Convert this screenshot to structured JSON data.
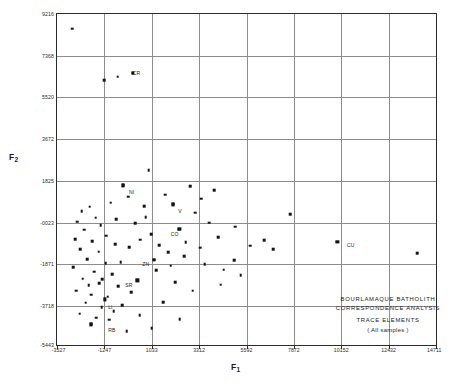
{
  "chart_data": {
    "type": "scatter",
    "title": "",
    "xlabel": "F1",
    "ylabel": "F2",
    "xlim": [
      -3527,
      14711
    ],
    "ylim": [
      -5443,
      9216
    ],
    "grid": true,
    "legend": null,
    "xticks": [
      "-3527",
      "-1247",
      "1033",
      "3312",
      "5592",
      "7872",
      "10152",
      "12432",
      "14711"
    ],
    "xtick_values": [
      -3527,
      -1247,
      1033,
      3312,
      5592,
      7872,
      10152,
      12432,
      14711
    ],
    "yticks": [
      "9216",
      "7368",
      "5520",
      "3672",
      "1825",
      "-0023",
      "-1871",
      "-3718",
      "-5443"
    ],
    "ytick_values": [
      9216,
      7368,
      5520,
      3672,
      1825,
      -23,
      -1871,
      -3718,
      -5443
    ],
    "annotations": [
      {
        "label": "CR",
        "x": 20.0,
        "y": 83.0
      },
      {
        "label": "NI",
        "x": 19.0,
        "y": 47.0
      },
      {
        "label": "V",
        "x": 32.0,
        "y": 41.5
      },
      {
        "label": "CO",
        "x": 30.0,
        "y": 34.5
      },
      {
        "label": "ZN",
        "x": 22.5,
        "y": 25.5
      },
      {
        "label": "SR",
        "x": 18.0,
        "y": 19.0
      },
      {
        "label": "LI",
        "x": 13.5,
        "y": 12.5
      },
      {
        "label": "RB",
        "x": 13.5,
        "y": 5.5
      },
      {
        "label": "CU",
        "x": 76.5,
        "y": 31.0
      }
    ],
    "labeled_points": [
      {
        "label": "CR",
        "xpct": 20.0,
        "ypct": 82.2
      },
      {
        "label": "NI",
        "xpct": 17.4,
        "ypct": 48.2
      },
      {
        "label": "V",
        "xpct": 30.6,
        "ypct": 42.5
      },
      {
        "label": "CO",
        "xpct": 32.3,
        "ypct": 35.0
      },
      {
        "label": "ZN",
        "xpct": 25.6,
        "ypct": 25.8
      },
      {
        "label": "SR",
        "xpct": 21.2,
        "ypct": 19.5
      },
      {
        "label": "LI",
        "xpct": 12.6,
        "ypct": 13.8
      },
      {
        "label": "RB",
        "xpct": 9.0,
        "ypct": 6.2
      },
      {
        "label": "CU",
        "xpct": 74.0,
        "ypct": 31.2
      }
    ],
    "points": [
      {
        "xpct": 4.0,
        "ypct": 95.5
      },
      {
        "xpct": 12.4,
        "ypct": 80.0
      },
      {
        "xpct": 16.0,
        "ypct": 81.0
      },
      {
        "xpct": 20.0,
        "ypct": 82.2
      },
      {
        "xpct": 17.4,
        "ypct": 48.2
      },
      {
        "xpct": 24.2,
        "ypct": 52.8
      },
      {
        "xpct": 30.6,
        "ypct": 42.5
      },
      {
        "xpct": 32.3,
        "ypct": 35.0
      },
      {
        "xpct": 25.6,
        "ypct": 25.8
      },
      {
        "xpct": 21.2,
        "ypct": 19.5
      },
      {
        "xpct": 12.6,
        "ypct": 13.8
      },
      {
        "xpct": 9.0,
        "ypct": 6.2
      },
      {
        "xpct": 74.0,
        "ypct": 31.2
      },
      {
        "xpct": 61.5,
        "ypct": 39.5
      },
      {
        "xpct": 95.0,
        "ypct": 27.8
      },
      {
        "xpct": 6.5,
        "ypct": 40.5
      },
      {
        "xpct": 8.6,
        "ypct": 41.8
      },
      {
        "xpct": 5.4,
        "ypct": 37.2
      },
      {
        "xpct": 10.2,
        "ypct": 38.4
      },
      {
        "xpct": 7.2,
        "ypct": 34.8
      },
      {
        "xpct": 11.5,
        "ypct": 36.2
      },
      {
        "xpct": 4.8,
        "ypct": 32.0
      },
      {
        "xpct": 9.3,
        "ypct": 31.4
      },
      {
        "xpct": 13.0,
        "ypct": 33.0
      },
      {
        "xpct": 6.2,
        "ypct": 29.0
      },
      {
        "xpct": 11.0,
        "ypct": 28.2
      },
      {
        "xpct": 15.4,
        "ypct": 30.5
      },
      {
        "xpct": 8.0,
        "ypct": 26.0
      },
      {
        "xpct": 12.8,
        "ypct": 24.8
      },
      {
        "xpct": 4.2,
        "ypct": 23.5
      },
      {
        "xpct": 9.8,
        "ypct": 22.2
      },
      {
        "xpct": 14.6,
        "ypct": 21.4
      },
      {
        "xpct": 6.8,
        "ypct": 20.0
      },
      {
        "xpct": 11.2,
        "ypct": 18.6
      },
      {
        "xpct": 16.2,
        "ypct": 17.8
      },
      {
        "xpct": 5.0,
        "ypct": 16.4
      },
      {
        "xpct": 9.0,
        "ypct": 15.2
      },
      {
        "xpct": 13.4,
        "ypct": 14.6
      },
      {
        "xpct": 7.6,
        "ypct": 12.8
      },
      {
        "xpct": 11.8,
        "ypct": 11.5
      },
      {
        "xpct": 15.0,
        "ypct": 10.2
      },
      {
        "xpct": 6.0,
        "ypct": 9.4
      },
      {
        "xpct": 10.4,
        "ypct": 8.2
      },
      {
        "xpct": 13.8,
        "ypct": 7.6
      },
      {
        "xpct": 17.2,
        "ypct": 12.0
      },
      {
        "xpct": 19.0,
        "ypct": 29.6
      },
      {
        "xpct": 22.0,
        "ypct": 31.8
      },
      {
        "xpct": 24.8,
        "ypct": 33.4
      },
      {
        "xpct": 20.6,
        "ypct": 36.8
      },
      {
        "xpct": 23.4,
        "ypct": 38.6
      },
      {
        "xpct": 27.0,
        "ypct": 30.2
      },
      {
        "xpct": 29.4,
        "ypct": 28.0
      },
      {
        "xpct": 26.2,
        "ypct": 22.6
      },
      {
        "xpct": 30.0,
        "ypct": 24.0
      },
      {
        "xpct": 33.6,
        "ypct": 26.8
      },
      {
        "xpct": 21.8,
        "ypct": 9.0
      },
      {
        "xpct": 25.0,
        "ypct": 5.0
      },
      {
        "xpct": 18.4,
        "ypct": 4.2
      },
      {
        "xpct": 28.6,
        "ypct": 45.4
      },
      {
        "xpct": 35.2,
        "ypct": 48.0
      },
      {
        "xpct": 38.0,
        "ypct": 44.2
      },
      {
        "xpct": 41.5,
        "ypct": 46.8
      },
      {
        "xpct": 36.4,
        "ypct": 40.0
      },
      {
        "xpct": 40.2,
        "ypct": 37.0
      },
      {
        "xpct": 34.0,
        "ypct": 31.0
      },
      {
        "xpct": 37.8,
        "ypct": 29.4
      },
      {
        "xpct": 42.6,
        "ypct": 32.6
      },
      {
        "xpct": 39.0,
        "ypct": 24.4
      },
      {
        "xpct": 44.0,
        "ypct": 22.8
      },
      {
        "xpct": 46.8,
        "ypct": 25.6
      },
      {
        "xpct": 48.5,
        "ypct": 21.0
      },
      {
        "xpct": 43.2,
        "ypct": 18.2
      },
      {
        "xpct": 51.0,
        "ypct": 30.0
      },
      {
        "xpct": 54.6,
        "ypct": 31.6
      },
      {
        "xpct": 57.0,
        "ypct": 29.0
      },
      {
        "xpct": 47.0,
        "ypct": 35.8
      },
      {
        "xpct": 31.2,
        "ypct": 19.0
      },
      {
        "xpct": 35.8,
        "ypct": 16.4
      },
      {
        "xpct": 28.0,
        "ypct": 13.0
      },
      {
        "xpct": 32.4,
        "ypct": 7.8
      },
      {
        "xpct": 23.0,
        "ypct": 42.0
      },
      {
        "xpct": 18.8,
        "ypct": 44.8
      },
      {
        "xpct": 14.2,
        "ypct": 43.0
      },
      {
        "xpct": 16.8,
        "ypct": 25.0
      },
      {
        "xpct": 19.6,
        "ypct": 16.0
      },
      {
        "xpct": 12.0,
        "ypct": 19.8
      },
      {
        "xpct": 8.4,
        "ypct": 18.0
      },
      {
        "xpct": 15.6,
        "ypct": 38.0
      }
    ]
  },
  "caption": {
    "line1": "BOURLAMAQUE  BATHOLITH",
    "line2": "CORRESPONDENCE  ANALYSIS",
    "line3": "TRACE  ELEMENTS",
    "line4": "( All  samples )"
  },
  "axis_titles": {
    "x_main": "F",
    "x_sub": "1",
    "y_main": "F",
    "y_sub": "2"
  }
}
